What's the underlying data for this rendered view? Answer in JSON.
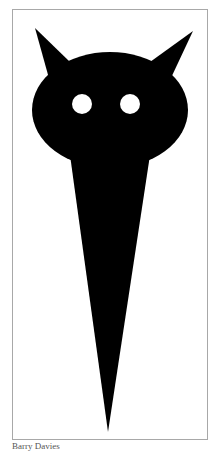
{
  "artwork": {
    "description": "Black silhouette of a horned cat-like head with two white round eyes, tapering into a long spike",
    "fill_color": "#000000",
    "eye_color": "#ffffff",
    "background_color": "#ffffff",
    "frame_color": "#a8a8a8"
  },
  "caption": {
    "text": "Barry Davies"
  }
}
